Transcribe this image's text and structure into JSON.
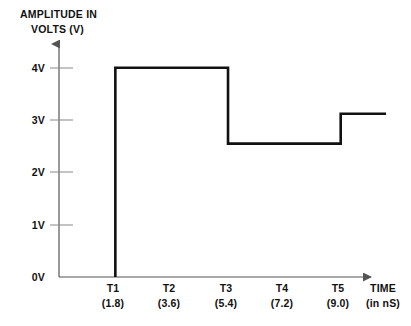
{
  "chart_data": {
    "type": "line",
    "title": "",
    "ylabel_lines": [
      "AMPLITUDE IN",
      "VOLTS (V)"
    ],
    "ylabel": "AMPLITUDE IN VOLTS (V)",
    "xlabel_lines": [
      "TIME",
      "(in nS)"
    ],
    "xlabel": "TIME (in nS)",
    "grid": false,
    "legend": "none",
    "ylim": [
      0,
      4.35
    ],
    "xlim": [
      0,
      10.1
    ],
    "y_ticks": [
      {
        "value": 0,
        "label": "0V"
      },
      {
        "value": 1,
        "label": "1V"
      },
      {
        "value": 2,
        "label": "2V"
      },
      {
        "value": 3,
        "label": "3V"
      },
      {
        "value": 4,
        "label": "4V"
      }
    ],
    "x_ticks": [
      {
        "name": "T1",
        "value": "(1.8)",
        "x": 1.8
      },
      {
        "name": "T2",
        "value": "(3.6)",
        "x": 3.6
      },
      {
        "name": "T3",
        "value": "(5.4)",
        "x": 5.4
      },
      {
        "name": "T4",
        "value": "(7.2)",
        "x": 7.2
      },
      {
        "name": "T5",
        "value": "(9.0)",
        "x": 9.0
      }
    ],
    "series": [
      {
        "name": "waveform",
        "color": "#111111",
        "step_points": [
          {
            "x": 1.8,
            "y": 0.0
          },
          {
            "x": 1.8,
            "y": 4.0
          },
          {
            "x": 5.4,
            "y": 4.0
          },
          {
            "x": 5.4,
            "y": 2.55
          },
          {
            "x": 9.0,
            "y": 2.55
          },
          {
            "x": 9.0,
            "y": 3.12
          },
          {
            "x": 10.45,
            "y": 3.12
          }
        ],
        "segments": [
          {
            "from_x": 1.8,
            "to_x": 5.4,
            "level": 4.0
          },
          {
            "from_x": 5.4,
            "to_x": 9.0,
            "level": 2.55
          },
          {
            "from_x": 9.0,
            "to_x": 10.45,
            "level": 3.12
          }
        ]
      }
    ],
    "axis_color": "#555555",
    "trace_color": "#111111",
    "background": "#ffffff"
  },
  "geometry": {
    "x_origin": 59,
    "y_origin": 277,
    "px_per_volt": 52.3,
    "px_per_ns": 31.3,
    "y_axis_top": 38,
    "x_axis_right": 378
  }
}
